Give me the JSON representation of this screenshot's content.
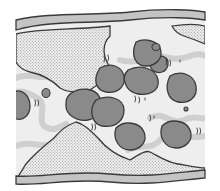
{
  "diagram": {
    "type": "schematic illustration",
    "colors": {
      "background": "#ffffff",
      "channel_fill": "#eeeeee",
      "wall_fill": "#c4c4c4",
      "outline": "#3a3a3a",
      "stipple_base": "#f2f2f2",
      "stipple_dot": "#9a9a9a",
      "blob_fill": "#8a8a8a",
      "strand": "#cfcfcf"
    },
    "elements": {
      "top_wall": "wavy upper boundary band",
      "bottom_wall": "wavy lower boundary band",
      "upper_mass": "stippled mass descending from top wall",
      "upper_right_mass": "small stippled patch at top right",
      "lower_mound": "stippled mound rising from bottom wall",
      "blobs_count": 11,
      "small_blobs_count": 3
    }
  }
}
